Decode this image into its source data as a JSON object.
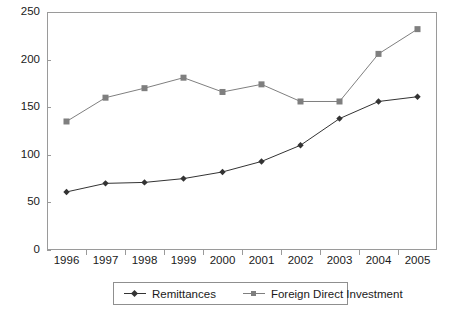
{
  "chart_data": {
    "type": "line",
    "title": "",
    "subtitle": "",
    "xlabel": "",
    "ylabel": "",
    "categories": [
      "1996",
      "1997",
      "1998",
      "1999",
      "2000",
      "2001",
      "2002",
      "2003",
      "2004",
      "2005"
    ],
    "series": [
      {
        "name": "Remittances",
        "marker": "diamond",
        "color": "#333333",
        "values": [
          61,
          70,
          71,
          75,
          82,
          93,
          110,
          138,
          156,
          161
        ]
      },
      {
        "name": "Foreign Direct Investment",
        "marker": "square",
        "color": "#7f7f7f",
        "values": [
          135,
          160,
          170,
          181,
          166,
          174,
          156,
          156,
          206,
          232
        ]
      }
    ],
    "ylim": [
      0,
      250
    ],
    "yticks": [
      0,
      50,
      100,
      150,
      200,
      250
    ],
    "ytick_labels": [
      "0",
      "50",
      "100",
      "150",
      "200",
      "250"
    ],
    "grid": false,
    "legend_position": "bottom",
    "frame_color": "#9a9a9a"
  }
}
